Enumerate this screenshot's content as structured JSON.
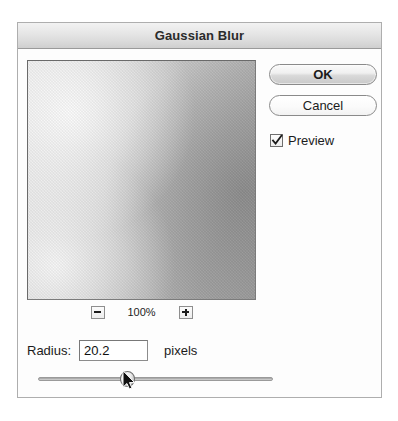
{
  "dialog": {
    "title": "Gaussian Blur"
  },
  "preview": {
    "name": "blur-preview-image",
    "zoom_level": "100%",
    "zoom_out_label": "−",
    "zoom_in_label": "+"
  },
  "buttons": {
    "ok": "OK",
    "cancel": "Cancel"
  },
  "preview_toggle": {
    "label": "Preview",
    "checked": true
  },
  "radius": {
    "label": "Radius:",
    "value": "20.2",
    "placeholder": "0.0",
    "units": "pixels"
  },
  "slider": {
    "name": "radius-slider",
    "value": 20.2,
    "min": 0.1,
    "max": 50.0,
    "thumb_position_percent": 38
  },
  "cursor": {
    "name": "mouse-pointer",
    "x": 128,
    "y": 380
  },
  "colors": {
    "dialog_background": "#fdfdfd",
    "dialog_border": "#aeaeae",
    "titlebar_top": "#f2f2f2",
    "titlebar_bottom": "#cfcfcf",
    "text": "#1c1c1c",
    "field_border": "#8c8c8c"
  }
}
